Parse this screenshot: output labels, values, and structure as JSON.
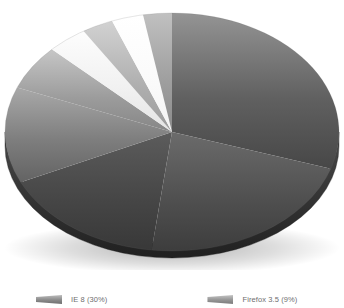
{
  "chart_data": {
    "type": "pie",
    "title": "",
    "subtitle": "",
    "xlabel": "",
    "ylabel": "",
    "legend_position": "bottom",
    "grid": false,
    "rendering": "3d-pie-grayscale",
    "categories": [
      "IE 8",
      "Firefox 3.5",
      "IE 7",
      "IE 6",
      "Chrome 3.0",
      "Safari 4.0",
      "Opera 10",
      "Chrome 2.0",
      "Other"
    ],
    "values": [
      30,
      22,
      16,
      13,
      6,
      4,
      3,
      3,
      3
    ],
    "labels": [
      "IE 8 (30%)",
      "Firefox 3.5 (22%)",
      "IE 7 (16%)",
      "IE 6 (13%)",
      "Chrome 3.0 (6%)",
      "Safari 4.0 (4%)",
      "Opera 10 (3%)",
      "Chrome 2.0 (3%)",
      "Other (3%)"
    ],
    "colors": [
      "#5a5a5a",
      "#4a4a4a",
      "#3f3f3f",
      "#707070",
      "#8f8f8f",
      "#f2f2f2",
      "#a8a8a8",
      "#fbfbfb",
      "#9a9a9a"
    ],
    "slices": [
      {
        "name": "IE 8",
        "value": 30,
        "percent": "30%",
        "start_deg": 0,
        "end_deg": 108,
        "color": "#5a5a5a"
      },
      {
        "name": "Firefox 3.5",
        "value": 22,
        "percent": "22%",
        "start_deg": 108,
        "end_deg": 187,
        "color": "#4a4a4a"
      },
      {
        "name": "IE 7",
        "value": 16,
        "percent": "16%",
        "start_deg": 187,
        "end_deg": 245,
        "color": "#3f3f3f"
      },
      {
        "name": "IE 6",
        "value": 13,
        "percent": "13%",
        "start_deg": 245,
        "end_deg": 292,
        "color": "#707070"
      },
      {
        "name": "Chrome 3.0",
        "value": 6,
        "percent": "6%",
        "start_deg": 292,
        "end_deg": 314,
        "color": "#8f8f8f"
      },
      {
        "name": "Safari 4.0",
        "value": 4,
        "percent": "4%",
        "start_deg": 314,
        "end_deg": 328,
        "color": "#f2f2f2"
      },
      {
        "name": "Opera 10",
        "value": 3,
        "percent": "3%",
        "start_deg": 328,
        "end_deg": 339,
        "color": "#a8a8a8"
      },
      {
        "name": "Chrome 2.0",
        "value": 3,
        "percent": "3%",
        "start_deg": 339,
        "end_deg": 350,
        "color": "#fbfbfb"
      },
      {
        "name": "Other",
        "value": 3,
        "percent": "3%",
        "start_deg": 350,
        "end_deg": 360,
        "color": "#9a9a9a"
      }
    ]
  },
  "legend": {
    "entries": [
      {
        "label": "IE 8 (30%)",
        "color": "#5a5a5a"
      },
      {
        "label": "Firefox 3.5 (9%)",
        "color": "#8d8d8d"
      }
    ]
  },
  "colors": {
    "background": "#ffffff",
    "rim_shadow": "#2b2b2b",
    "legend_text": "#6e6e6e"
  }
}
